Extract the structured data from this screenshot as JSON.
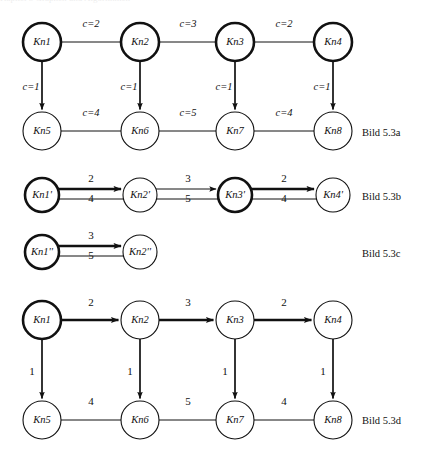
{
  "page": {
    "width": 427,
    "height": 457,
    "background": "#ffffff",
    "ink_color": "#111111",
    "clipped_header_text": "Kapitel 5  Graphen und Algorithmen"
  },
  "figures": [
    {
      "id": "bild-5-3a",
      "caption": "Bild 5.3a",
      "caption_pos": {
        "x": 362,
        "y": 136
      },
      "type": "graph",
      "description": "Zwei Reihen von je vier Knoten, waagerechte ungerichtete Kanten, senkrechte gerichtete Kanten mit c= Beschriftungen",
      "node_radius": 19,
      "nodes": [
        {
          "id": "n1",
          "label": "Kn1",
          "x": 42,
          "y": 42,
          "style": "bold"
        },
        {
          "id": "n2",
          "label": "Kn2",
          "x": 140,
          "y": 42,
          "style": "bold"
        },
        {
          "id": "n3",
          "label": "Kn3",
          "x": 235,
          "y": 42,
          "style": "bold"
        },
        {
          "id": "n4",
          "label": "Kn4",
          "x": 333,
          "y": 42,
          "style": "bold"
        },
        {
          "id": "n5",
          "label": "Kn5",
          "x": 42,
          "y": 131,
          "style": "thin"
        },
        {
          "id": "n6",
          "label": "Kn6",
          "x": 140,
          "y": 131,
          "style": "thin"
        },
        {
          "id": "n7",
          "label": "Kn7",
          "x": 235,
          "y": 131,
          "style": "thin"
        },
        {
          "id": "n8",
          "label": "Kn8",
          "x": 333,
          "y": 131,
          "style": "thin"
        }
      ],
      "edges": [
        {
          "from": "n1",
          "to": "n2",
          "label": "c=2",
          "label_x": 91,
          "label_y": 27,
          "weight": "thin",
          "arrow": false,
          "orientation": "h"
        },
        {
          "from": "n2",
          "to": "n3",
          "label": "c=3",
          "label_x": 188,
          "label_y": 27,
          "weight": "thin",
          "arrow": false,
          "orientation": "h"
        },
        {
          "from": "n3",
          "to": "n4",
          "label": "c=2",
          "label_x": 284,
          "label_y": 27,
          "weight": "thin",
          "arrow": false,
          "orientation": "h"
        },
        {
          "from": "n5",
          "to": "n6",
          "label": "c=4",
          "label_x": 91,
          "label_y": 116,
          "weight": "thin",
          "arrow": false,
          "orientation": "h"
        },
        {
          "from": "n6",
          "to": "n7",
          "label": "c=5",
          "label_x": 188,
          "label_y": 116,
          "weight": "thin",
          "arrow": false,
          "orientation": "h"
        },
        {
          "from": "n7",
          "to": "n8",
          "label": "c=4",
          "label_x": 284,
          "label_y": 116,
          "weight": "thin",
          "arrow": false,
          "orientation": "h"
        },
        {
          "from": "n1",
          "to": "n5",
          "label": "c=1",
          "label_x": 31,
          "label_y": 90,
          "weight": "medium",
          "arrow": true,
          "orientation": "v"
        },
        {
          "from": "n2",
          "to": "n6",
          "label": "c=1",
          "label_x": 129,
          "label_y": 90,
          "weight": "medium",
          "arrow": true,
          "orientation": "v"
        },
        {
          "from": "n3",
          "to": "n7",
          "label": "c=1",
          "label_x": 224,
          "label_y": 90,
          "weight": "medium",
          "arrow": true,
          "orientation": "v"
        },
        {
          "from": "n4",
          "to": "n8",
          "label": "c=1",
          "label_x": 322,
          "label_y": 90,
          "weight": "medium",
          "arrow": true,
          "orientation": "v"
        }
      ]
    },
    {
      "id": "bild-5-3b",
      "caption": "Bild 5.3b",
      "caption_pos": {
        "x": 362,
        "y": 200
      },
      "type": "graph",
      "description": "Vier Knoten mit Strich, je zwei parallele Kanten (fette obere mit Pfeil, duenne untere)",
      "node_radius": 17,
      "nodes": [
        {
          "id": "m1",
          "label": "Kn1'",
          "x": 42,
          "y": 195,
          "style": "bold"
        },
        {
          "id": "m2",
          "label": "Kn2'",
          "x": 140,
          "y": 195,
          "style": "thin"
        },
        {
          "id": "m3",
          "label": "Kn3'",
          "x": 235,
          "y": 195,
          "style": "bold"
        },
        {
          "id": "m4",
          "label": "Kn4'",
          "x": 333,
          "y": 195,
          "style": "thin"
        }
      ],
      "edge_pairs": [
        {
          "from": "m1",
          "to": "m2",
          "top_label": "2",
          "top_label_x": 91,
          "top_label_y": 182,
          "top_weight": "bold",
          "bottom_label": "4",
          "bottom_label_x": 91,
          "bottom_label_y": 202,
          "bottom_weight": "thin"
        },
        {
          "from": "m2",
          "to": "m3",
          "top_label": "3",
          "top_label_x": 188,
          "top_label_y": 182,
          "top_weight": "thin",
          "bottom_label": "5",
          "bottom_label_x": 188,
          "bottom_label_y": 202,
          "bottom_weight": "thin"
        },
        {
          "from": "m3",
          "to": "m4",
          "top_label": "2",
          "top_label_x": 284,
          "top_label_y": 182,
          "top_weight": "bold",
          "bottom_label": "4",
          "bottom_label_x": 284,
          "bottom_label_y": 202,
          "bottom_weight": "thin"
        }
      ]
    },
    {
      "id": "bild-5-3c",
      "caption": "Bild 5.3c",
      "caption_pos": {
        "x": 362,
        "y": 257
      },
      "type": "graph",
      "description": "Zwei Knoten mit Doppelstrich, zwei parallele Kanten",
      "node_radius": 17,
      "nodes": [
        {
          "id": "p1",
          "label": "Kn1''",
          "x": 42,
          "y": 252,
          "style": "bold"
        },
        {
          "id": "p2",
          "label": "Kn2''",
          "x": 140,
          "y": 252,
          "style": "thin"
        }
      ],
      "edge_pairs": [
        {
          "from": "p1",
          "to": "p2",
          "top_label": "3",
          "top_label_x": 91,
          "top_label_y": 239,
          "top_weight": "bold",
          "bottom_label": "5",
          "bottom_label_x": 91,
          "bottom_label_y": 259,
          "bottom_weight": "thin"
        }
      ]
    },
    {
      "id": "bild-5-3d",
      "caption": "Bild 5.3d",
      "caption_pos": {
        "x": 362,
        "y": 424
      },
      "type": "graph",
      "description": "Wie Bild 5.3a, aber obere Reihe gerichtet, Kantengewichte ohne c=",
      "node_radius": 19,
      "nodes": [
        {
          "id": "q1",
          "label": "Kn1",
          "x": 42,
          "y": 320,
          "style": "bold"
        },
        {
          "id": "q2",
          "label": "Kn2",
          "x": 140,
          "y": 320,
          "style": "thin"
        },
        {
          "id": "q3",
          "label": "Kn3",
          "x": 235,
          "y": 320,
          "style": "thin"
        },
        {
          "id": "q4",
          "label": "Kn4",
          "x": 333,
          "y": 320,
          "style": "thin"
        },
        {
          "id": "q5",
          "label": "Kn5",
          "x": 42,
          "y": 420,
          "style": "thin"
        },
        {
          "id": "q6",
          "label": "Kn6",
          "x": 140,
          "y": 420,
          "style": "thin"
        },
        {
          "id": "q7",
          "label": "Kn7",
          "x": 235,
          "y": 420,
          "style": "thin"
        },
        {
          "id": "q8",
          "label": "Kn8",
          "x": 333,
          "y": 420,
          "style": "thin"
        }
      ],
      "edges": [
        {
          "from": "q1",
          "to": "q2",
          "label": "2",
          "label_x": 91,
          "label_y": 306,
          "weight": "bold",
          "arrow": true,
          "orientation": "h"
        },
        {
          "from": "q2",
          "to": "q3",
          "label": "3",
          "label_x": 188,
          "label_y": 306,
          "weight": "bold",
          "arrow": true,
          "orientation": "h"
        },
        {
          "from": "q3",
          "to": "q4",
          "label": "2",
          "label_x": 284,
          "label_y": 306,
          "weight": "bold",
          "arrow": true,
          "orientation": "h"
        },
        {
          "from": "q5",
          "to": "q6",
          "label": "4",
          "label_x": 91,
          "label_y": 405,
          "weight": "thin",
          "arrow": false,
          "orientation": "h"
        },
        {
          "from": "q6",
          "to": "q7",
          "label": "5",
          "label_x": 188,
          "label_y": 405,
          "weight": "thin",
          "arrow": false,
          "orientation": "h"
        },
        {
          "from": "q7",
          "to": "q8",
          "label": "4",
          "label_x": 284,
          "label_y": 405,
          "weight": "thin",
          "arrow": false,
          "orientation": "h"
        },
        {
          "from": "q1",
          "to": "q5",
          "label": "1",
          "label_x": 32,
          "label_y": 375,
          "weight": "medium",
          "arrow": true,
          "orientation": "v"
        },
        {
          "from": "q2",
          "to": "q6",
          "label": "1",
          "label_x": 130,
          "label_y": 375,
          "weight": "medium",
          "arrow": true,
          "orientation": "v"
        },
        {
          "from": "q3",
          "to": "q7",
          "label": "1",
          "label_x": 225,
          "label_y": 375,
          "weight": "medium",
          "arrow": true,
          "orientation": "v"
        },
        {
          "from": "q4",
          "to": "q8",
          "label": "1",
          "label_x": 323,
          "label_y": 375,
          "weight": "medium",
          "arrow": true,
          "orientation": "v"
        }
      ]
    }
  ]
}
